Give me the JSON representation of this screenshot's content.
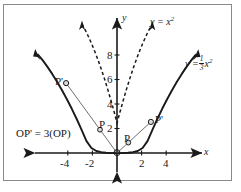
{
  "figure": {
    "kind": "graph",
    "background_color": "#ffffff",
    "border_color": "#8a8a8a",
    "curve_color": "#1a1a1a"
  },
  "axes": {
    "x_axis_label": "x",
    "y_axis_label": "y",
    "x_ticks": [
      "-4",
      "-2",
      "2",
      "4"
    ],
    "x_tick_values": [
      -4,
      -2,
      2,
      4
    ],
    "y_ticks": [
      "2",
      "4",
      "6",
      "8"
    ],
    "y_tick_values": [
      2,
      4,
      6,
      8
    ],
    "xlim": [
      -5.6,
      5.6
    ],
    "ylim": [
      -1.4,
      9.8
    ],
    "origin_px": [
      117,
      153
    ],
    "x_scale_px_per_unit": 12.3,
    "y_scale_px_per_unit": 12.25
  },
  "curves": [
    {
      "name": "parabola-x-squared",
      "label": "y = x²",
      "label_base": "y = x",
      "label_exponent": "2",
      "equation": "y = x^2",
      "coefficient": 1,
      "style": "dashed",
      "arrows": "both"
    },
    {
      "name": "parabola-one-third-x-squared",
      "label": "y = 1/3 x²",
      "label_base": "y =",
      "label_numerator": "1",
      "label_denominator": "3",
      "label_variable": "x",
      "label_exponent": "2",
      "equation": "y = (1/3)x^2",
      "coefficient": 0.3333,
      "style": "solid",
      "arrows": "both"
    }
  ],
  "points": [
    {
      "name": "P-left",
      "label": "P",
      "on_curve": "y = x²",
      "x": -1.38,
      "y": 1.9
    },
    {
      "name": "Pprime-left",
      "label": "P'",
      "on_curve": "y = 1/3 x²",
      "x": -4.14,
      "y": 5.71
    },
    {
      "name": "P-right",
      "label": "P",
      "on_curve": "y = x²",
      "x": 0.92,
      "y": 0.85
    },
    {
      "name": "Pprime-right",
      "label": "P'",
      "on_curve": "y = 1/3 x²",
      "x": 2.76,
      "y": 2.54
    }
  ],
  "rays": [
    {
      "name": "ray-left",
      "from": [
        0,
        0
      ],
      "to": [
        -4.14,
        5.71
      ]
    },
    {
      "name": "ray-right",
      "from": [
        0,
        0
      ],
      "to": [
        2.76,
        2.54
      ]
    }
  ],
  "annotation": {
    "name": "relation-note",
    "text": "OP' = 3(OP)"
  }
}
